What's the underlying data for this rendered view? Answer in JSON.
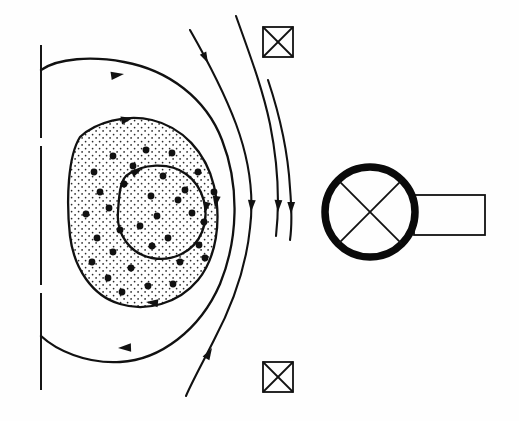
{
  "figure": {
    "background_color": "#fefefe",
    "ink_color": "#111111"
  },
  "chart_data": {
    "type": "diagram",
    "xlabel": "",
    "ylabel": "",
    "circulation_sense": "clockwise",
    "axis": {
      "name": "centerline",
      "orientation": "vertical",
      "style": "long-dash",
      "x": 41,
      "y_start": 45,
      "y_end": 390,
      "dash_segments": [
        [
          45,
          138
        ],
        [
          146,
          285
        ],
        [
          293,
          390
        ]
      ]
    },
    "contours": [
      {
        "name": "outer-streamline",
        "closed": true,
        "path": "M 41,70 C 58,58 92,56 124,62 C 168,70 206,98 222,140 C 240,186 238,240 220,284 C 200,330 160,360 120,362 C 86,364 56,350 41,336 Z",
        "arrow_positions": [
          {
            "at": "top",
            "x": 118,
            "y": 73,
            "angle": 12,
            "direction": "right"
          },
          {
            "at": "bottom",
            "x": 126,
            "y": 347,
            "angle": 184,
            "direction": "left"
          }
        ]
      },
      {
        "name": "middle-streamline",
        "closed": true,
        "filled": true,
        "fill": "stipple",
        "path": "M 80,137 C 96,122 126,114 152,120 C 182,127 206,152 214,186 C 222,222 216,258 198,280 C 178,304 146,312 120,304 C 92,296 74,268 70,236 C 66,200 68,156 80,137 Z",
        "arrow_positions": [
          {
            "at": "top",
            "x": 128,
            "y": 119,
            "angle": 8,
            "direction": "right"
          },
          {
            "at": "right",
            "x": 207,
            "y": 203,
            "angle": 96,
            "direction": "down"
          },
          {
            "at": "bottom",
            "x": 152,
            "y": 300,
            "angle": 188,
            "direction": "left"
          }
        ]
      },
      {
        "name": "inner-streamline",
        "closed": true,
        "path": "M 126,176 C 142,163 170,162 186,174 C 204,187 210,212 202,232 C 194,252 172,262 152,258 C 130,254 116,234 118,212 C 119,196 120,182 126,176 Z",
        "arrow_positions": [
          {
            "at": "top-left",
            "x": 139,
            "y": 170,
            "angle": 18,
            "direction": "right"
          },
          {
            "at": "right",
            "x": 202,
            "y": 208,
            "angle": 100,
            "direction": "down"
          }
        ]
      }
    ],
    "open_streamlines": [
      {
        "name": "outer-open-streamline-1",
        "path": "M 190,30 C 206,58 224,92 236,124 C 250,162 254,196 250,228 C 246,268 232,306 214,340 C 202,364 192,382 186,396",
        "arrow_positions": [
          {
            "x": 229,
            "y": 207,
            "angle": 94,
            "direction": "down"
          },
          {
            "x": 209,
            "y": 352,
            "angle": 248,
            "direction": "up-right"
          }
        ]
      },
      {
        "name": "outer-open-streamline-2",
        "path": "M 236,16 C 248,50 262,86 270,124 C 278,164 280,200 276,236",
        "arrow_positions": [
          {
            "x": 262,
            "y": 204,
            "angle": 92,
            "direction": "down"
          }
        ]
      },
      {
        "name": "outer-open-streamline-3",
        "path": "M 268,80 C 280,116 288,152 290,188 C 292,212 292,226 290,240",
        "arrow_positions": [
          {
            "x": 286,
            "y": 205,
            "angle": 91,
            "direction": "down"
          }
        ]
      }
    ],
    "core_dots": {
      "name": "scattered-core-dots",
      "count": 33,
      "radius_px": 3.4,
      "points": [
        [
          113,
          156
        ],
        [
          146,
          150
        ],
        [
          172,
          153
        ],
        [
          94,
          172
        ],
        [
          133,
          166
        ],
        [
          198,
          172
        ],
        [
          100,
          192
        ],
        [
          124,
          184
        ],
        [
          163,
          176
        ],
        [
          185,
          190
        ],
        [
          86,
          214
        ],
        [
          109,
          208
        ],
        [
          151,
          196
        ],
        [
          178,
          200
        ],
        [
          214,
          192
        ],
        [
          97,
          238
        ],
        [
          120,
          230
        ],
        [
          157,
          216
        ],
        [
          192,
          213
        ],
        [
          204,
          222
        ],
        [
          92,
          262
        ],
        [
          113,
          252
        ],
        [
          140,
          226
        ],
        [
          168,
          238
        ],
        [
          199,
          245
        ],
        [
          108,
          278
        ],
        [
          131,
          268
        ],
        [
          152,
          246
        ],
        [
          180,
          262
        ],
        [
          205,
          258
        ],
        [
          122,
          292
        ],
        [
          148,
          286
        ],
        [
          173,
          284
        ]
      ]
    },
    "stipple": {
      "name": "stipple-texture",
      "spacing_px": 7,
      "dot_radius_px": 0.85,
      "description": "uniform fine dot fill inside middle streamline"
    },
    "symbols": [
      {
        "name": "x-in-square-top",
        "shape": "square-with-x",
        "x": 263,
        "y": 27,
        "width": 30,
        "height": 30
      },
      {
        "name": "x-in-square-bottom",
        "shape": "square-with-x",
        "x": 263,
        "y": 362,
        "width": 30,
        "height": 30
      },
      {
        "name": "x-in-circle-with-tab",
        "shape": "circle-with-x",
        "cx": 370,
        "cy": 212,
        "r": 45,
        "stroke_width": 7.5,
        "tab": {
          "name": "rectangle-tab",
          "x": 414,
          "y": 195,
          "width": 71,
          "height": 40
        }
      }
    ]
  }
}
